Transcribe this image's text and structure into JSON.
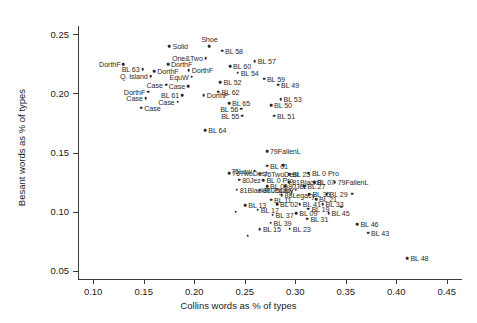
{
  "chart_data": {
    "type": "scatter",
    "title": "",
    "xlabel": "Collins words as % of types",
    "ylabel": "Besant words as % of types",
    "xlim": [
      0.085,
      0.465
    ],
    "ylim": [
      0.043,
      0.257
    ],
    "xticks": [
      "0.10",
      "0.15",
      "0.20",
      "0.25",
      "0.30",
      "0.35",
      "0.40",
      "0.45"
    ],
    "xtick_values": [
      0.1,
      0.15,
      0.2,
      0.25,
      0.3,
      0.35,
      0.4,
      0.45
    ],
    "yticks": [
      "0.05",
      "0.10",
      "0.15",
      "0.20",
      "0.25"
    ],
    "ytick_values": [
      0.05,
      0.1,
      0.15,
      0.2,
      0.25
    ],
    "grid": false,
    "legend": "none",
    "marker": "filled-circle",
    "marker_color": "#2b2b2b",
    "points": [
      {
        "label": "Solid",
        "x": 0.1755,
        "y": 0.24,
        "pos": "right"
      },
      {
        "label": "Shoe",
        "x": 0.215,
        "y": 0.24,
        "pos": "top"
      },
      {
        "label": "BL 58",
        "x": 0.2275,
        "y": 0.236,
        "pos": "right"
      },
      {
        "label": "One&Two",
        "x": 0.2115,
        "y": 0.23,
        "pos": "left"
      },
      {
        "label": "BL 57",
        "x": 0.26,
        "y": 0.227,
        "pos": "right"
      },
      {
        "label": "DorthF",
        "x": 0.13,
        "y": 0.2245,
        "pos": "left"
      },
      {
        "label": "DorthF",
        "x": 0.174,
        "y": 0.2245,
        "pos": "right"
      },
      {
        "label": "BL 60",
        "x": 0.2355,
        "y": 0.223,
        "pos": "right"
      },
      {
        "label": "BL 63",
        "x": 0.149,
        "y": 0.2205,
        "pos": "left"
      },
      {
        "label": "DorthF",
        "x": 0.1605,
        "y": 0.219,
        "pos": "right"
      },
      {
        "label": "DorthF",
        "x": 0.1945,
        "y": 0.2195,
        "pos": "right"
      },
      {
        "label": "BL 54",
        "x": 0.243,
        "y": 0.2175,
        "pos": "right"
      },
      {
        "label": "Q. Island",
        "x": 0.157,
        "y": 0.2145,
        "pos": "left"
      },
      {
        "label": "EquW",
        "x": 0.1975,
        "y": 0.214,
        "pos": "left"
      },
      {
        "label": "BL 59",
        "x": 0.269,
        "y": 0.2125,
        "pos": "right"
      },
      {
        "label": "BL 52",
        "x": 0.226,
        "y": 0.2095,
        "pos": "right"
      },
      {
        "label": "Case",
        "x": 0.172,
        "y": 0.2075,
        "pos": "left"
      },
      {
        "label": "Case",
        "x": 0.194,
        "y": 0.206,
        "pos": "left"
      },
      {
        "label": "BL 49",
        "x": 0.283,
        "y": 0.2075,
        "pos": "right"
      },
      {
        "label": "DorthF",
        "x": 0.1545,
        "y": 0.2015,
        "pos": "left"
      },
      {
        "label": "BL 62",
        "x": 0.224,
        "y": 0.2015,
        "pos": "right"
      },
      {
        "label": "BL 61",
        "x": 0.188,
        "y": 0.1985,
        "pos": "left"
      },
      {
        "label": "DorthF",
        "x": 0.2095,
        "y": 0.1985,
        "pos": "right"
      },
      {
        "label": "Case",
        "x": 0.152,
        "y": 0.196,
        "pos": "left"
      },
      {
        "label": "BL 53",
        "x": 0.2855,
        "y": 0.195,
        "pos": "right"
      },
      {
        "label": "Case",
        "x": 0.1835,
        "y": 0.193,
        "pos": "left"
      },
      {
        "label": "BL 65",
        "x": 0.2345,
        "y": 0.1915,
        "pos": "right"
      },
      {
        "label": "BL 50",
        "x": 0.276,
        "y": 0.19,
        "pos": "right"
      },
      {
        "label": "Case",
        "x": 0.1475,
        "y": 0.188,
        "pos": "right"
      },
      {
        "label": "BL 56",
        "x": 0.2465,
        "y": 0.187,
        "pos": "left"
      },
      {
        "label": "BL 55",
        "x": 0.2475,
        "y": 0.181,
        "pos": "left"
      },
      {
        "label": "BL 51",
        "x": 0.279,
        "y": 0.181,
        "pos": "right"
      },
      {
        "label": "BL 64",
        "x": 0.211,
        "y": 0.169,
        "pos": "right"
      },
      {
        "label": "79FallenL",
        "x": 0.272,
        "y": 0.151,
        "pos": "right"
      },
      {
        "label": "BL 01",
        "x": 0.272,
        "y": 0.139,
        "pos": "right"
      },
      {
        "label": "75Law",
        "x": 0.26,
        "y": 0.1345,
        "pos": "left"
      },
      {
        "label": "76TwoDest",
        "x": 0.2345,
        "y": 0.1325,
        "pos": "right"
      },
      {
        "label": "76TwoDest",
        "x": 0.2655,
        "y": 0.132,
        "pos": "right"
      },
      {
        "label": "BL 25",
        "x": 0.294,
        "y": 0.1315,
        "pos": "right"
      },
      {
        "label": "BL 0 Pro",
        "x": 0.3135,
        "y": 0.1325,
        "pos": "right"
      },
      {
        "label": "80Jez",
        "x": 0.2445,
        "y": 0.127,
        "pos": "right"
      },
      {
        "label": "BL 0 Pro",
        "x": 0.2685,
        "y": 0.1265,
        "pos": "right"
      },
      {
        "label": "81BlackR",
        "x": 0.294,
        "y": 0.125,
        "pos": "right"
      },
      {
        "label": "BL 07",
        "x": 0.3185,
        "y": 0.125,
        "pos": "right"
      },
      {
        "label": "79FallenL",
        "x": 0.339,
        "y": 0.125,
        "pos": "right"
      },
      {
        "label": "BL 05",
        "x": 0.272,
        "y": 0.1215,
        "pos": "right"
      },
      {
        "label": "80Jez",
        "x": 0.29,
        "y": 0.1215,
        "pos": "right"
      },
      {
        "label": "BL 27",
        "x": 0.309,
        "y": 0.1215,
        "pos": "right"
      },
      {
        "label": "81BlackR",
        "x": 0.242,
        "y": 0.1185,
        "pos": "right"
      },
      {
        "label": "88Legacy",
        "x": 0.265,
        "y": 0.118,
        "pos": "right"
      },
      {
        "label": "75Law",
        "x": 0.3005,
        "y": 0.1185,
        "pos": "left"
      },
      {
        "label": "88Legacy",
        "x": 0.2865,
        "y": 0.114,
        "pos": "right"
      },
      {
        "label": "BL 35",
        "x": 0.314,
        "y": 0.1145,
        "pos": "right"
      },
      {
        "label": "BL 29",
        "x": 0.331,
        "y": 0.1145,
        "pos": "right"
      },
      {
        "label": "BL 11",
        "x": 0.276,
        "y": 0.11,
        "pos": "right"
      },
      {
        "label": "BL 21",
        "x": 0.3205,
        "y": 0.1105,
        "pos": "right"
      },
      {
        "label": "BL 13",
        "x": 0.2505,
        "y": 0.1055,
        "pos": "right"
      },
      {
        "label": "BL 02",
        "x": 0.282,
        "y": 0.1065,
        "pos": "right"
      },
      {
        "label": "BL 41",
        "x": 0.3045,
        "y": 0.1065,
        "pos": "right"
      },
      {
        "label": "BL 33",
        "x": 0.327,
        "y": 0.1065,
        "pos": "right"
      },
      {
        "label": "BL 17",
        "x": 0.263,
        "y": 0.1015,
        "pos": "right"
      },
      {
        "label": "BL 19",
        "x": 0.313,
        "y": 0.1025,
        "pos": "right"
      },
      {
        "label": "BL 37",
        "x": 0.2775,
        "y": 0.0975,
        "pos": "right"
      },
      {
        "label": "BL 09",
        "x": 0.301,
        "y": 0.0985,
        "pos": "right"
      },
      {
        "label": "BL 45",
        "x": 0.333,
        "y": 0.0985,
        "pos": "right"
      },
      {
        "label": "BL 31",
        "x": 0.312,
        "y": 0.094,
        "pos": "right"
      },
      {
        "label": "BL 39",
        "x": 0.2755,
        "y": 0.0905,
        "pos": "right"
      },
      {
        "label": "BL 46",
        "x": 0.3615,
        "y": 0.0895,
        "pos": "right"
      },
      {
        "label": "BL 15",
        "x": 0.265,
        "y": 0.085,
        "pos": "right"
      },
      {
        "label": "BL 23",
        "x": 0.2945,
        "y": 0.0855,
        "pos": "right"
      },
      {
        "label": "BL 43",
        "x": 0.372,
        "y": 0.082,
        "pos": "right"
      },
      {
        "label": "BL 48",
        "x": 0.411,
        "y": 0.0605,
        "pos": "right"
      },
      {
        "label": "",
        "x": 0.241,
        "y": 0.1,
        "pos": "right"
      },
      {
        "label": "",
        "x": 0.253,
        "y": 0.0795,
        "pos": "right"
      },
      {
        "label": "",
        "x": 0.3455,
        "y": 0.104,
        "pos": "right"
      },
      {
        "label": "",
        "x": 0.3565,
        "y": 0.115,
        "pos": "right"
      },
      {
        "label": "",
        "x": 0.288,
        "y": 0.1395,
        "pos": "right"
      }
    ]
  }
}
